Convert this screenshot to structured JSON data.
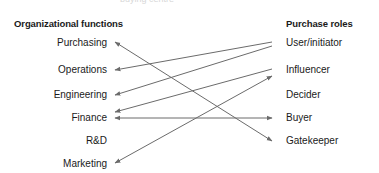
{
  "figure": {
    "background_color": "#ffffff",
    "line_color": "#6b6b6b",
    "text_color": "#1a1a1a",
    "clipped_top_text": "buying centre"
  },
  "headings": {
    "left": "Organizational functions",
    "right": "Purchase roles"
  },
  "chart_data": {
    "type": "diagram",
    "title": "",
    "left_column_title": "Organizational functions",
    "right_column_title": "Purchase roles",
    "left_nodes": [
      {
        "id": "purchasing",
        "label": "Purchasing",
        "x": 268,
        "y": 43
      },
      {
        "id": "operations",
        "label": "Operations",
        "x": 268,
        "y": 70
      },
      {
        "id": "engineering",
        "label": "Engineering",
        "x": 268,
        "y": 95
      },
      {
        "id": "finance",
        "label": "Finance",
        "x": 268,
        "y": 118
      },
      {
        "id": "rd",
        "label": "R&D",
        "x": 268,
        "y": 141
      },
      {
        "id": "marketing",
        "label": "Marketing",
        "x": 268,
        "y": 164
      }
    ],
    "right_nodes": [
      {
        "id": "user_initiator",
        "label": "User/initiator",
        "x": 282,
        "y": 43
      },
      {
        "id": "influencer",
        "label": "Influencer",
        "x": 282,
        "y": 70
      },
      {
        "id": "decider",
        "label": "Decider",
        "x": 282,
        "y": 95
      },
      {
        "id": "buyer",
        "label": "Buyer",
        "x": 282,
        "y": 118
      },
      {
        "id": "gatekeeper",
        "label": "Gatekeeper",
        "x": 282,
        "y": 141
      }
    ],
    "links": [
      {
        "from": "purchasing",
        "to": "gatekeeper",
        "arrows": "both",
        "x1": 115,
        "y1": 42,
        "x2": 272,
        "y2": 141
      },
      {
        "from": "user_initiator",
        "to": "operations",
        "arrows": "start",
        "x1": 115,
        "y1": 70,
        "x2": 272,
        "y2": 42
      },
      {
        "from": "user_initiator",
        "to": "engineering",
        "arrows": "start",
        "x1": 115,
        "y1": 95,
        "x2": 272,
        "y2": 46
      },
      {
        "from": "influencer",
        "to": "finance",
        "arrows": "start",
        "x1": 115,
        "y1": 112,
        "x2": 272,
        "y2": 69
      },
      {
        "from": "finance",
        "to": "buyer",
        "arrows": "both",
        "x1": 115,
        "y1": 118,
        "x2": 272,
        "y2": 118
      },
      {
        "from": "marketing",
        "to": "influencer",
        "arrows": "both",
        "x1": 115,
        "y1": 163,
        "x2": 272,
        "y2": 76
      }
    ]
  }
}
